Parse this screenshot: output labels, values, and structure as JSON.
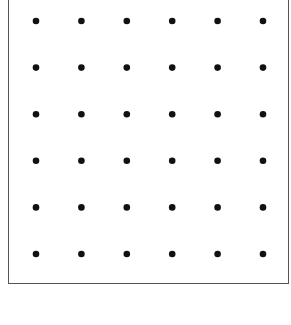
{
  "diagram": {
    "type": "dot-grid",
    "rows": 6,
    "columns": 6,
    "dot_color": "#111111",
    "frame_color": "#555555",
    "background": "#ffffff"
  }
}
